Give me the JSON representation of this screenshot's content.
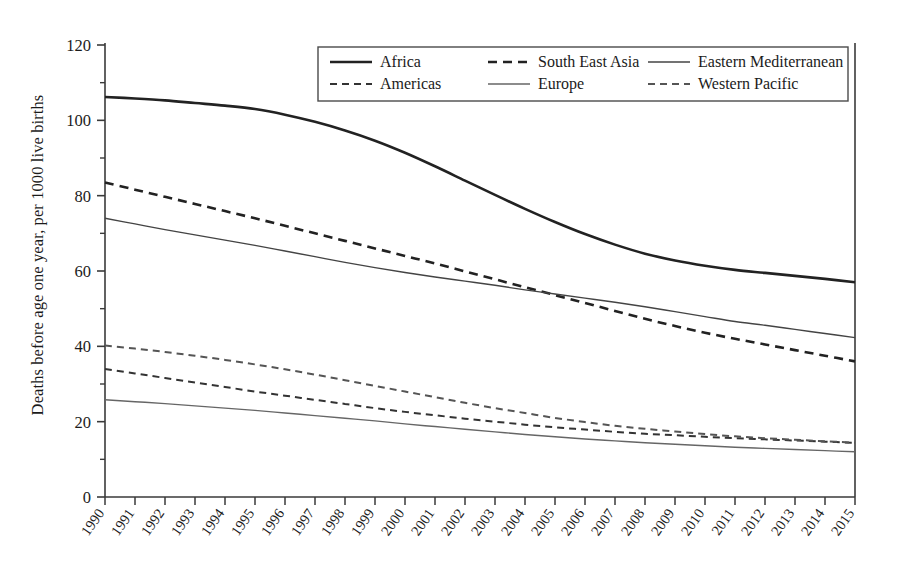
{
  "chart_data": {
    "type": "line",
    "title": "",
    "xlabel": "",
    "ylabel": "Deaths before age one year, per 1000 live births",
    "x": [
      1990,
      1991,
      1992,
      1993,
      1994,
      1995,
      1996,
      1997,
      1998,
      1999,
      2000,
      2001,
      2002,
      2003,
      2004,
      2005,
      2006,
      2007,
      2008,
      2009,
      2010,
      2011,
      2012,
      2013,
      2014,
      2015
    ],
    "xtick_labels": [
      "1990",
      "1991",
      "1992",
      "1993",
      "1994",
      "1995",
      "1996",
      "1997",
      "1998",
      "1999",
      "2000",
      "2001",
      "2002",
      "2003",
      "2004",
      "2005",
      "2006",
      "2007",
      "2008",
      "2009",
      "2010",
      "2011",
      "2012",
      "2013",
      "2014",
      "2015"
    ],
    "ytick_labels": [
      "0",
      "20",
      "40",
      "60",
      "80",
      "100",
      "120"
    ],
    "yticks": [
      0,
      20,
      40,
      60,
      80,
      100,
      120
    ],
    "ylim": [
      0,
      120
    ],
    "xlim": [
      1990,
      2015
    ],
    "grid": false,
    "legend_position": "top-center",
    "series": [
      {
        "name": "Africa",
        "style": "solid",
        "width": 2.6,
        "color": "#222222",
        "values": [
          106.2,
          105.8,
          105.3,
          104.6,
          103.9,
          103.0,
          101.5,
          99.6,
          97.3,
          94.6,
          91.4,
          87.8,
          84.0,
          80.2,
          76.5,
          73.0,
          69.8,
          67.0,
          64.6,
          62.8,
          61.4,
          60.3,
          59.5,
          58.7,
          57.9,
          57.0
        ]
      },
      {
        "name": "South East Asia",
        "style": "dashed",
        "width": 2.6,
        "color": "#222222",
        "values": [
          83.5,
          81.6,
          79.7,
          77.8,
          75.9,
          74.0,
          72.0,
          70.0,
          68.0,
          66.0,
          64.0,
          62.0,
          59.9,
          57.8,
          55.7,
          53.6,
          51.5,
          49.4,
          47.3,
          45.4,
          43.6,
          42.0,
          40.5,
          39.0,
          37.5,
          36.0
        ]
      },
      {
        "name": "Eastern Mediterranean",
        "style": "solid",
        "width": 1.4,
        "color": "#444444",
        "values": [
          74.0,
          72.5,
          71.0,
          69.6,
          68.2,
          66.8,
          65.3,
          63.8,
          62.3,
          60.9,
          59.6,
          58.4,
          57.3,
          56.2,
          55.0,
          53.9,
          52.8,
          51.7,
          50.5,
          49.2,
          47.9,
          46.6,
          45.6,
          44.5,
          43.4,
          42.3
        ]
      },
      {
        "name": "Americas",
        "style": "dashed",
        "width": 2.0,
        "color": "#333333",
        "values": [
          34.0,
          32.8,
          31.6,
          30.4,
          29.2,
          28.0,
          26.9,
          25.8,
          24.7,
          23.6,
          22.6,
          21.7,
          20.8,
          20.0,
          19.2,
          18.5,
          17.9,
          17.3,
          16.8,
          16.4,
          16.0,
          15.6,
          15.3,
          15.0,
          14.7,
          14.4
        ]
      },
      {
        "name": "Europe",
        "style": "solid",
        "width": 1.4,
        "color": "#666666",
        "values": [
          25.8,
          25.3,
          24.8,
          24.2,
          23.6,
          23.0,
          22.3,
          21.6,
          20.9,
          20.2,
          19.4,
          18.7,
          18.0,
          17.3,
          16.6,
          16.0,
          15.4,
          14.9,
          14.4,
          14.0,
          13.6,
          13.2,
          12.9,
          12.6,
          12.3,
          12.0
        ]
      },
      {
        "name": "Western Pacific",
        "style": "dashed",
        "width": 2.0,
        "color": "#555555",
        "values": [
          40.2,
          39.4,
          38.5,
          37.5,
          36.4,
          35.2,
          33.9,
          32.5,
          31.0,
          29.5,
          28.0,
          26.5,
          25.0,
          23.6,
          22.3,
          21.0,
          19.9,
          18.9,
          18.1,
          17.4,
          16.7,
          16.1,
          15.6,
          15.2,
          14.8,
          14.4
        ]
      }
    ],
    "legend": [
      {
        "label": "Africa",
        "style": "solid",
        "width": 2.6,
        "color": "#222222"
      },
      {
        "label": "South East Asia",
        "style": "dashed",
        "width": 2.6,
        "color": "#222222"
      },
      {
        "label": "Eastern Mediterranean",
        "style": "solid",
        "width": 1.4,
        "color": "#444444"
      },
      {
        "label": "Americas",
        "style": "dashed",
        "width": 2.0,
        "color": "#333333"
      },
      {
        "label": "Europe",
        "style": "solid",
        "width": 1.4,
        "color": "#666666"
      },
      {
        "label": "Western Pacific",
        "style": "dashed",
        "width": 2.0,
        "color": "#555555"
      }
    ]
  }
}
